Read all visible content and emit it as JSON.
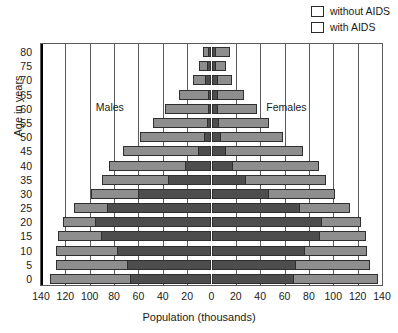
{
  "chart_data": {
    "type": "bar",
    "subtype": "population-pyramid",
    "title": "",
    "xlabel": "Population (thousands)",
    "ylabel": "Age in years",
    "xlim": [
      -140,
      140
    ],
    "xticks": [
      140,
      120,
      100,
      80,
      60,
      40,
      20,
      0,
      20,
      40,
      60,
      80,
      100,
      120,
      140
    ],
    "xtick_labels": [
      "140",
      "120",
      "100",
      "80",
      "60",
      "40",
      "20",
      "0",
      "20",
      "40",
      "60",
      "80",
      "100",
      "120",
      "140"
    ],
    "categories": [
      "0",
      "5",
      "10",
      "15",
      "20",
      "25",
      "30",
      "35",
      "40",
      "45",
      "50",
      "55",
      "60",
      "65",
      "70",
      "75",
      "80"
    ],
    "ytick_labels": [
      "80",
      "75",
      "70",
      "65",
      "60",
      "55",
      "50",
      "45",
      "40",
      "35",
      "30",
      "25",
      "20",
      "15",
      "10",
      "5",
      "0"
    ],
    "grid": true,
    "legend_position": "top-right",
    "legend": [
      {
        "name": "without AIDS",
        "color": "#8e8e8e"
      },
      {
        "name": "with AIDS",
        "color": "#4d4d4d"
      }
    ],
    "annotations": [
      {
        "text": "Males",
        "side": "left"
      },
      {
        "text": "Females",
        "side": "right"
      }
    ],
    "series": [
      {
        "name": "Males",
        "side": "left",
        "with_aids": [
          67,
          69,
          78,
          91,
          96,
          86,
          60,
          36,
          22,
          11,
          6,
          4,
          3,
          3,
          5,
          4,
          3
        ],
        "without_aids": [
          133,
          128,
          128,
          126,
          122,
          113,
          99,
          90,
          84,
          73,
          59,
          48,
          38,
          27,
          15,
          10,
          7
        ]
      },
      {
        "name": "Females",
        "side": "right",
        "with_aids": [
          68,
          69,
          77,
          89,
          91,
          73,
          47,
          28,
          18,
          12,
          8,
          6,
          5,
          5,
          5,
          4,
          4
        ],
        "without_aids": [
          137,
          130,
          128,
          127,
          123,
          114,
          101,
          94,
          88,
          75,
          59,
          47,
          37,
          27,
          17,
          12,
          15
        ]
      }
    ]
  },
  "legend": {
    "items": [
      {
        "label": "without AIDS",
        "swatch": "#8e8e8e"
      },
      {
        "label": "with AIDS",
        "swatch": "#4d4d4d"
      }
    ]
  },
  "axes": {
    "x_title": "Population (thousands)",
    "y_title": "Age in years"
  },
  "annotations": {
    "males": "Males",
    "females": "Females"
  }
}
